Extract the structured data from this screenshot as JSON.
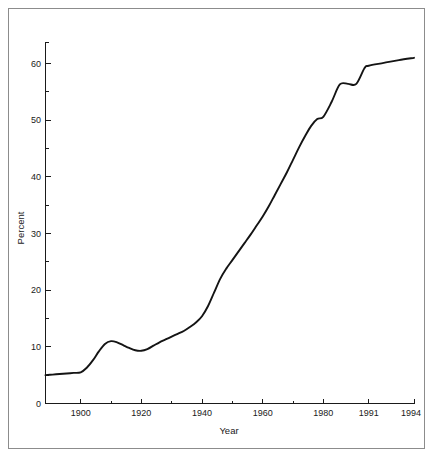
{
  "figure": {
    "background_color": "#ffffff",
    "border_color": "#8c8c8c",
    "line_color": "#141414",
    "text_color": "#1a1a1a"
  },
  "chart_data": {
    "type": "line",
    "title": "",
    "subtitle": "",
    "xlabel": "Year",
    "ylabel": "Percent",
    "grid": false,
    "legend": "none",
    "xlim": [
      1890,
      1994
    ],
    "ylim": [
      0,
      65
    ],
    "x_tick_labels": [
      "1900",
      "1920",
      "1940",
      "1960",
      "1980",
      "1991",
      "1994"
    ],
    "x_tick_values": [
      1900,
      1920,
      1940,
      1960,
      1980,
      1991,
      1994
    ],
    "x_minor_tick_values": [
      1910,
      1930,
      1950,
      1970
    ],
    "x_axis_note": "non-uniform spacing: 1980, 1991 and 1994 are evenly spaced",
    "y_tick_labels": [
      "0",
      "10",
      "20",
      "30",
      "40",
      "50",
      "60"
    ],
    "y_tick_values": [
      0,
      10,
      20,
      30,
      40,
      50,
      60
    ],
    "y_minor_tick_values": [
      5,
      15,
      25,
      35,
      45,
      55,
      65
    ],
    "series": [
      {
        "name": "Percent",
        "x": [
          1890,
          1892,
          1894,
          1896,
          1898,
          1900,
          1902,
          1904,
          1906,
          1908,
          1910,
          1912,
          1914,
          1916,
          1918,
          1920,
          1922,
          1924,
          1926,
          1928,
          1930,
          1932,
          1934,
          1936,
          1938,
          1940,
          1942,
          1944,
          1946,
          1948,
          1950,
          1952,
          1954,
          1956,
          1958,
          1960,
          1962,
          1964,
          1966,
          1968,
          1970,
          1972,
          1974,
          1976,
          1978,
          1980,
          1982,
          1984,
          1986,
          1988,
          1990,
          1991,
          1992,
          1993,
          1994
        ],
        "values": [
          5.0,
          5.1,
          5.2,
          5.3,
          5.4,
          5.5,
          6.3,
          7.6,
          9.2,
          10.5,
          11.0,
          10.8,
          10.3,
          9.8,
          9.4,
          9.3,
          9.6,
          10.2,
          10.8,
          11.3,
          11.8,
          12.3,
          12.8,
          13.5,
          14.3,
          15.4,
          17.2,
          19.6,
          22.0,
          23.8,
          25.3,
          26.8,
          28.3,
          29.8,
          31.4,
          33.0,
          34.8,
          36.8,
          38.8,
          40.8,
          43.0,
          45.2,
          47.2,
          49.0,
          50.2,
          50.6,
          53.2,
          56.3,
          56.4,
          56.4,
          59.2,
          59.6,
          60.1,
          60.6,
          61.0
        ]
      }
    ]
  }
}
